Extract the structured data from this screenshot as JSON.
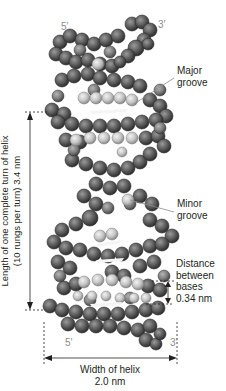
{
  "figure": {
    "strand_ends": {
      "top_left": "5′",
      "top_right": "3′",
      "bottom_left": "5′",
      "bottom_right": "3′"
    },
    "labels": {
      "major_groove": [
        "Major",
        "groove"
      ],
      "minor_groove": [
        "Minor",
        "groove"
      ],
      "distance_between_bases": [
        "Distance",
        "between",
        "bases",
        "0.34 nm"
      ],
      "helix_turn_length": [
        "Length of one complete turn of helix",
        "(10 rungs per turn) 3.4 nm"
      ],
      "helix_width": [
        "Width of helix",
        "2.0 nm"
      ]
    },
    "colors": {
      "atom_dark": "#5a5a5a",
      "atom_mid": "#7a7a7a",
      "atom_light": "#c8c8c8",
      "base_pair": "#d6d6d6",
      "annotation_line": "#231f20",
      "strand_end_text": "#8c8c8c"
    }
  }
}
